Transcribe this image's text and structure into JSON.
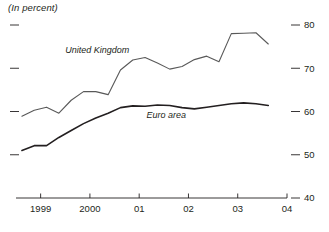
{
  "chart": {
    "title": "(In percent)"
  },
  "chart_data": {
    "type": "line",
    "title": "(In percent)",
    "subtitle": "",
    "xlabel": "",
    "ylabel": "",
    "ylim": [
      40,
      82
    ],
    "xlim": [
      1998.5,
      2004.0
    ],
    "grid": false,
    "legend": "inline-annotations",
    "yticks": [
      80,
      70,
      60,
      50,
      40
    ],
    "ytick_labels": [
      "80",
      "70",
      "60",
      "50",
      "40"
    ],
    "ytick_side": "both",
    "xticks": [
      1999,
      2000,
      2001,
      2002,
      2003,
      2004
    ],
    "xtick_labels": [
      "1999",
      "2000",
      "01",
      "02",
      "03",
      "04"
    ],
    "annotations": [
      {
        "text": "United Kingdom",
        "x": 2000.15,
        "y": 73.6
      },
      {
        "text": "Euro area",
        "x": 2001.55,
        "y": 58.6
      }
    ],
    "series": [
      {
        "name": "United Kingdom",
        "color": "#595959",
        "width": 1.1,
        "x": [
          1998.62,
          1998.87,
          1999.12,
          1999.37,
          1999.62,
          1999.87,
          2000.12,
          2000.37,
          2000.62,
          2000.87,
          2001.12,
          2001.37,
          2001.62,
          2001.87,
          2002.12,
          2002.37,
          2002.62,
          2002.87,
          2003.12,
          2003.37,
          2003.62
        ],
        "y": [
          58.9,
          60.3,
          61.0,
          59.6,
          62.6,
          64.6,
          64.6,
          63.9,
          69.6,
          71.9,
          72.5,
          71.2,
          69.8,
          70.4,
          72.0,
          72.8,
          71.5,
          78.0,
          78.1,
          78.2,
          75.6
        ]
      },
      {
        "name": "Euro area",
        "color": "#231f20",
        "width": 1.6,
        "x": [
          1998.62,
          1998.87,
          1999.12,
          1999.37,
          1999.62,
          1999.87,
          2000.12,
          2000.37,
          2000.62,
          2000.87,
          2001.12,
          2001.37,
          2001.62,
          2001.87,
          2002.12,
          2002.37,
          2002.62,
          2002.87,
          2003.12,
          2003.37,
          2003.62
        ],
        "y": [
          51.0,
          52.1,
          52.1,
          54.0,
          55.6,
          57.2,
          58.5,
          59.6,
          60.9,
          61.3,
          61.2,
          61.5,
          61.4,
          60.9,
          60.6,
          61.0,
          61.4,
          61.8,
          62.0,
          61.8,
          61.4
        ]
      }
    ]
  }
}
